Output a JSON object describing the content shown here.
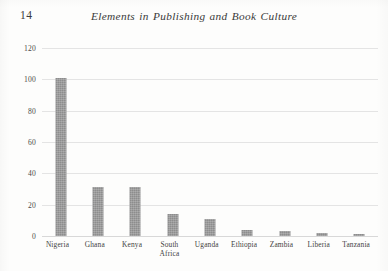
{
  "page": {
    "folio": "14",
    "running_head": "Elements in Publishing and Book Culture"
  },
  "chart_data": {
    "type": "bar",
    "title": "",
    "xlabel": "",
    "ylabel": "",
    "categories": [
      "Nigeria",
      "Ghana",
      "Kenya",
      "South Africa",
      "Uganda",
      "Ethiopia",
      "Zambia",
      "Liberia",
      "Tanzania"
    ],
    "category_lines": [
      [
        "Nigeria"
      ],
      [
        "Ghana"
      ],
      [
        "Kenya"
      ],
      [
        "South",
        "Africa"
      ],
      [
        "Uganda"
      ],
      [
        "Ethiopia"
      ],
      [
        "Zambia"
      ],
      [
        "Liberia"
      ],
      [
        "Tanzania"
      ]
    ],
    "values": [
      101,
      31,
      31,
      14,
      11,
      4,
      3,
      2,
      1
    ],
    "ylim": [
      0,
      120
    ],
    "yticks": [
      0,
      20,
      40,
      60,
      80,
      100,
      120
    ],
    "ytick_labels": [
      "0",
      "20",
      "40",
      "60",
      "80",
      "100",
      "120"
    ],
    "grid": true,
    "legend": "none",
    "bar_color": "#8d8d8d",
    "gridline_color": "#e4e4e4"
  }
}
